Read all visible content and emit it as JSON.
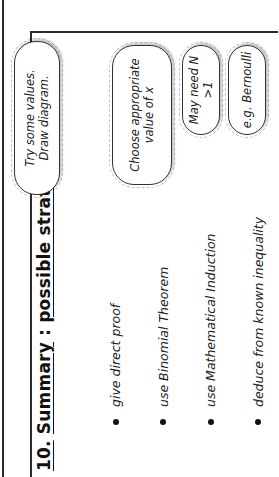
{
  "slide": {
    "rotation": "rotated 90deg counter-clockwise",
    "title_number": "10.",
    "title_word": "Summary",
    "title_sep": " : ",
    "title_rest": "possible strategies",
    "strategies": [
      {
        "text": "give direct proof"
      },
      {
        "text": "use Binomial Theorem"
      },
      {
        "text": "use Mathematical Induction"
      },
      {
        "text": "deduce from known inequality"
      }
    ],
    "callouts": [
      {
        "line1": "Try some values.",
        "line2": "Draw diagram."
      },
      {
        "line1": "Choose appropriate",
        "line2": "value of x"
      },
      {
        "line1": "May need N >1",
        "line2": ""
      },
      {
        "line1": "e.g. Bernoulli",
        "line2": ""
      }
    ],
    "colors": {
      "line": "#2a2a2a",
      "text": "#222222",
      "background": "#ffffff"
    }
  }
}
